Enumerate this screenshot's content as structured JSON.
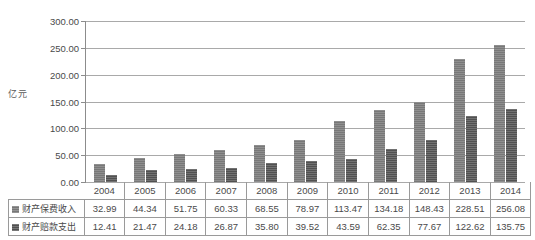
{
  "chart_data": {
    "type": "bar",
    "title": "",
    "subtitle": "",
    "xlabel": "",
    "ylabel": "亿元",
    "categories": [
      "2004",
      "2005",
      "2006",
      "2007",
      "2008",
      "2009",
      "2010",
      "2011",
      "2012",
      "2013",
      "2014"
    ],
    "series": [
      {
        "name": "财产保费收入",
        "color": "#7d7d7d",
        "values": [
          32.99,
          44.34,
          51.75,
          60.33,
          68.55,
          78.97,
          113.47,
          134.18,
          148.43,
          228.51,
          256.08
        ]
      },
      {
        "name": "财产赔款支出",
        "color": "#565656",
        "values": [
          12.41,
          21.47,
          24.18,
          26.87,
          35.8,
          39.52,
          43.59,
          62.35,
          77.67,
          122.62,
          135.75
        ]
      }
    ],
    "ylim": [
      0,
      300
    ],
    "ytick_values": [
      0,
      50,
      100,
      150,
      200,
      250,
      300
    ],
    "ytick_labels": [
      "0.00",
      "50.00",
      "100.00",
      "150.00",
      "200.00",
      "250.00",
      "300.00"
    ],
    "grid": true,
    "legend_position": "data-table-row-labels"
  },
  "data_table": {
    "corner_label": "",
    "header": [
      "2004",
      "2005",
      "2006",
      "2007",
      "2008",
      "2009",
      "2010",
      "2011",
      "2012",
      "2013",
      "2014"
    ],
    "rows": [
      {
        "label": "财产保费收入",
        "swatch": "series-0-swatch",
        "values": [
          "32.99",
          "44.34",
          "51.75",
          "60.33",
          "68.55",
          "78.97",
          "113.47",
          "134.18",
          "148.43",
          "228.51",
          "256.08"
        ]
      },
      {
        "label": "财产赔款支出",
        "swatch": "series-1-swatch",
        "values": [
          "12.41",
          "21.47",
          "24.18",
          "26.87",
          "35.80",
          "39.52",
          "43.59",
          "62.35",
          "77.67",
          "122.62",
          "135.75"
        ]
      }
    ]
  },
  "colors": {
    "series_0": "#7d7d7d",
    "series_1": "#565656",
    "gridline": "#a9a9a9",
    "axis": "#8c8c8c",
    "table_border": "#9a9a9a",
    "text": "#4a4a4a",
    "background": "#ffffff"
  }
}
